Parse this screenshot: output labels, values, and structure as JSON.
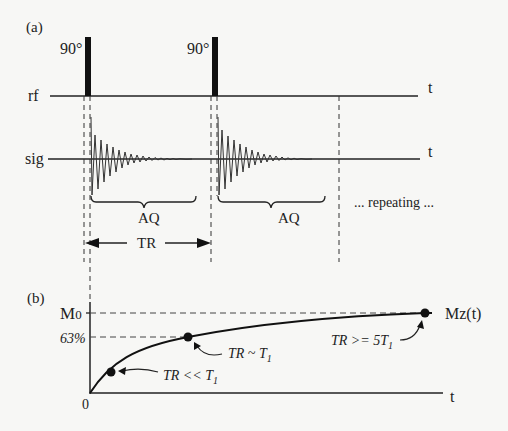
{
  "panel_a": {
    "label": "(a)",
    "pulse_labels": [
      "90°",
      "90°"
    ],
    "rf_label": "rf",
    "sig_label": "sig",
    "rf_axis_label": "t",
    "sig_axis_label": "t",
    "aq_labels": [
      "AQ",
      "AQ"
    ],
    "tr_label": "TR",
    "repeating_label": "... repeating ..."
  },
  "panel_b": {
    "label": "(b)",
    "y_top_label": "M",
    "y_top_sub": "0",
    "y_mid_label": "63%",
    "origin_label": "0",
    "x_axis_label": "t",
    "curve_label": "Mz(t)",
    "annotations": [
      {
        "text": "TR << T",
        "sub": "1"
      },
      {
        "text": "TR ~ T",
        "sub": "1"
      },
      {
        "text": "TR >= 5T",
        "sub": "1"
      }
    ]
  },
  "colors": {
    "ink": "#222222",
    "background": "#f7f7f5"
  }
}
